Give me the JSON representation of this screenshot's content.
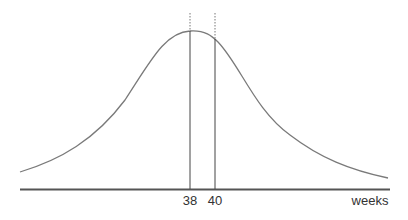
{
  "diagram": {
    "type": "bell-curve",
    "x_axis_label": "weeks",
    "markers": [
      {
        "label": "38",
        "x": 190
      },
      {
        "label": "40",
        "x": 215
      }
    ],
    "colors": {
      "curve": "#7a7a7a",
      "axis": "#555555",
      "marker": "#444444",
      "label": "#333333"
    }
  }
}
